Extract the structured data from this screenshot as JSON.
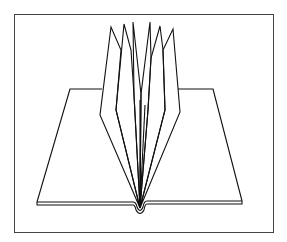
{
  "figure": {
    "caption": "",
    "colors": {
      "background": "#ffffff",
      "line": "#111111",
      "frame": "#333333"
    },
    "page_count_fanned": 6
  }
}
